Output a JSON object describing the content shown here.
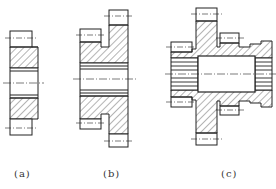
{
  "figure": {
    "colors": {
      "line": "#222222",
      "hatch": "#444444",
      "centerline": "#333333",
      "background": "#ffffff"
    },
    "subfigures": [
      {
        "id": "a",
        "label": "(a)",
        "type": "single gear section"
      },
      {
        "id": "b",
        "label": "(b)",
        "type": "double gear section"
      },
      {
        "id": "c",
        "label": "(c)",
        "type": "multi gear cluster section"
      }
    ]
  }
}
